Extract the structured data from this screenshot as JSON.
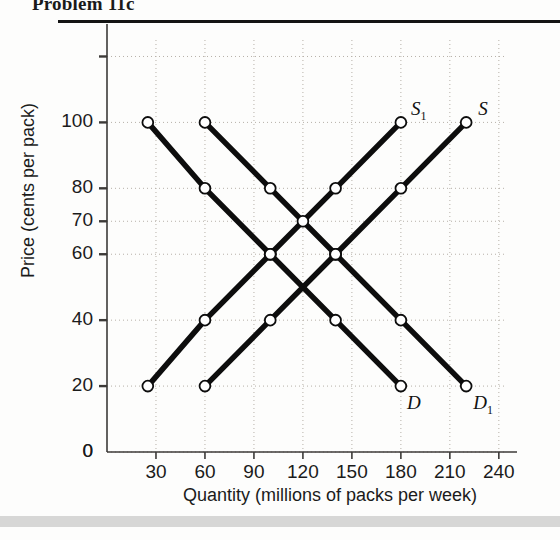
{
  "figure": {
    "title": "Problem 11c",
    "x_label": "Quantity (millions of packs per week)",
    "y_label": "Price (cents per pack)"
  },
  "axes": {
    "x_ticks": [
      "30",
      "60",
      "90",
      "120",
      "150",
      "180",
      "210",
      "240"
    ],
    "y_ticks": [
      "0",
      "20",
      "40",
      "60",
      "70",
      "80",
      "100"
    ],
    "origin_label": "0"
  },
  "curve_labels": {
    "s": "S",
    "s1_base": "S",
    "s1_sub": "1",
    "d": "D",
    "d1_base": "D",
    "d1_sub": "1"
  },
  "colors": {
    "line": "#0d0d0d",
    "marker_fill": "#ffffff",
    "grid": "#b6b0a8",
    "axis": "#3c3a38"
  },
  "chart_data": {
    "type": "line",
    "title": "Problem 11c",
    "xlabel": "Quantity (millions of packs per week)",
    "ylabel": "Price (cents per pack)",
    "xlim": [
      0,
      245
    ],
    "ylim": [
      0,
      125
    ],
    "xticks": [
      30,
      60,
      90,
      120,
      150,
      180,
      210,
      240
    ],
    "yticks": [
      0,
      20,
      40,
      60,
      70,
      80,
      100,
      120
    ],
    "ytick_labels_shown": [
      0,
      20,
      40,
      60,
      70,
      80,
      100
    ],
    "grid": true,
    "legend": "inline-curve-labels",
    "series": [
      {
        "name": "D",
        "role": "demand",
        "label_position": "end-below",
        "points": [
          {
            "x": 25,
            "y": 100
          },
          {
            "x": 60,
            "y": 80
          },
          {
            "x": 100,
            "y": 60
          },
          {
            "x": 140,
            "y": 40
          },
          {
            "x": 180,
            "y": 20
          }
        ]
      },
      {
        "name": "D1",
        "role": "demand-shifted-right",
        "label_position": "end-below",
        "points": [
          {
            "x": 60,
            "y": 100
          },
          {
            "x": 100,
            "y": 80
          },
          {
            "x": 140,
            "y": 60
          },
          {
            "x": 180,
            "y": 40
          },
          {
            "x": 220,
            "y": 20
          }
        ]
      },
      {
        "name": "S1",
        "role": "supply-shifted-left",
        "label_position": "end-above",
        "points": [
          {
            "x": 25,
            "y": 20
          },
          {
            "x": 60,
            "y": 40
          },
          {
            "x": 100,
            "y": 60
          },
          {
            "x": 140,
            "y": 80
          },
          {
            "x": 180,
            "y": 100
          }
        ]
      },
      {
        "name": "S",
        "role": "supply",
        "label_position": "end-above",
        "points": [
          {
            "x": 60,
            "y": 20
          },
          {
            "x": 100,
            "y": 40
          },
          {
            "x": 140,
            "y": 60
          },
          {
            "x": 180,
            "y": 80
          },
          {
            "x": 220,
            "y": 100
          }
        ]
      }
    ],
    "intersections": [
      {
        "x": 120,
        "y": 70,
        "note": "S1 with D1"
      },
      {
        "x": 100,
        "y": 60,
        "note": "S1 with D"
      },
      {
        "x": 140,
        "y": 60,
        "note": "S with D1"
      }
    ]
  }
}
